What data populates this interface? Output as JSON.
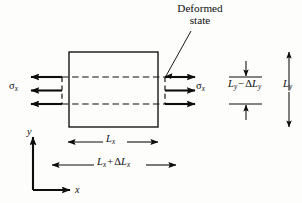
{
  "figure": {
    "type": "mechanics-strain-diagram",
    "background_color": "#fdfdfc",
    "ink_color": "#0d0d0d",
    "annotations": {
      "deformed_state": {
        "line1": "Deformed",
        "line2": "state"
      },
      "stress_left": "σx",
      "stress_right": "σx",
      "height_deformed": "Ly − ΔLy",
      "height_original": "Ly",
      "width_original": "Lx",
      "width_deformed": "Lx + ΔLx",
      "axis_y": "y",
      "axis_x": "x"
    },
    "symbols": {
      "sigma": "σ",
      "delta": "Δ",
      "minus": "−",
      "plus": "+",
      "L": "L",
      "sub_x": "x",
      "sub_y": "y"
    },
    "geometry": {
      "original_rect": {
        "x": 69,
        "y": 52,
        "width": 89,
        "height": 75
      },
      "deformed_rect": {
        "x": 62,
        "y": 77,
        "width": 103,
        "height": 27
      },
      "axis_origin": {
        "x": 33,
        "y": 190
      },
      "axis_y_top": 135,
      "axis_x_right": 72,
      "dim_lx": {
        "x1": 68,
        "x2": 158,
        "y": 142
      },
      "dim_lx_plus": {
        "x1": 52,
        "x2": 176,
        "y": 165
      },
      "ly_minus_bar_top": 77,
      "ly_minus_bar_bottom": 104,
      "ly_arrow_x": 289,
      "ly_top": 52,
      "ly_bottom": 127
    },
    "arrows": {
      "left_stress_count": 3,
      "right_stress_count": 3,
      "left_stress_direction": "left",
      "right_stress_direction": "right"
    }
  }
}
